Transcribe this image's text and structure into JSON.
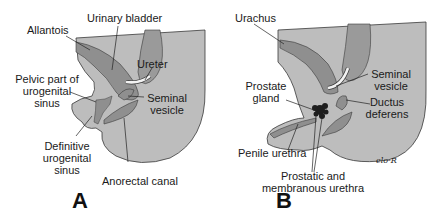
{
  "figure": {
    "panels": [
      {
        "letter": "A",
        "labels": {
          "urinary_bladder": "Urinary bladder",
          "allantois": "Allantois",
          "ureter": "Ureter",
          "pelvic_part_1": "Pelvic part of",
          "pelvic_part_2": "urogenital",
          "pelvic_part_3": "sinus",
          "seminal_vesicle_1": "Seminal",
          "seminal_vesicle_2": "vesicle",
          "definitive_1": "Definitive",
          "definitive_2": "urogenital",
          "definitive_3": "sinus",
          "anorectal_canal": "Anorectal canal"
        }
      },
      {
        "letter": "B",
        "labels": {
          "urachus": "Urachus",
          "seminal_vesicle_1": "Seminal",
          "seminal_vesicle_2": "vesicle",
          "prostate_gland_1": "Prostate",
          "prostate_gland_2": "gland",
          "ductus_deferens_1": "Ductus",
          "ductus_deferens_2": "deferens",
          "penile_urethra": "Penile urethra",
          "prostatic_1": "Prostatic and",
          "prostatic_2": "membranous urethra"
        },
        "signature": "elo-R"
      }
    ],
    "colors": {
      "body_fill": "#bdbdbd",
      "organ_fill": "#8f8f8f",
      "organ_dark": "#7a7a7a",
      "outline": "#3a3a3a",
      "ureter_fill": "#f2f2f2",
      "prostate": "#1e1e1e"
    }
  }
}
